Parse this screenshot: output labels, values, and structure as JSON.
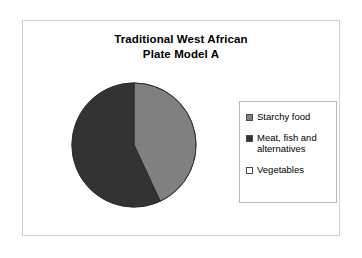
{
  "chart_data": {
    "type": "pie",
    "title": "Traditional West African Plate Model A",
    "title_lines": [
      "Traditional West African",
      "Plate Model A"
    ],
    "categories": [
      "Starchy food",
      "Meat, fish and alternatives",
      "Vegetables"
    ],
    "values": [
      43,
      57,
      0
    ],
    "colors": [
      "#808080",
      "#333333",
      "#ffffff"
    ],
    "legend_position": "right",
    "grid": false,
    "xlabel": "",
    "ylabel": "",
    "slice_start_angle_deg": 0,
    "slice_sweeps_deg": [
      155,
      205,
      0
    ]
  },
  "slide": {
    "title": {
      "line1": "Traditional West African",
      "line2": "Plate Model A"
    }
  },
  "legend": {
    "items": [
      {
        "label": "Starchy food",
        "color": "#808080"
      },
      {
        "label": "Meat, fish and\nalternatives",
        "color": "#333333"
      },
      {
        "label": "Vegetables",
        "color": "#ffffff"
      }
    ]
  }
}
